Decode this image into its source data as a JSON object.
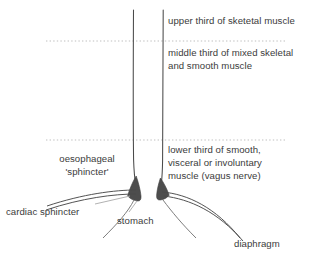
{
  "diagram": {
    "colors": {
      "text": "#3b3b3b",
      "stroke": "#4a4a4a",
      "wedge_fill": "#4d4d4d",
      "divider": "#bfbfbf",
      "leader": "#9a9a9a",
      "background": "#ffffff"
    },
    "labels": {
      "upper_third": "upper third of sketetal muscle",
      "middle_third_line1": "middle third of mixed skeletal",
      "middle_third_line2": "and smooth muscle",
      "lower_third_line1": "lower third of smooth,",
      "lower_third_line2": "visceral or involuntary",
      "lower_third_line3": "muscle (vagus nerve)",
      "oesophageal_line1": "oesophageal",
      "oesophageal_line2": "'sphincter'",
      "cardiac_sphincter": "cardiac sphincter",
      "stomach": "stomach",
      "diaphragm": "diaphragm"
    },
    "dividers": [
      {
        "name": "upper-middle-divider",
        "y": 41
      },
      {
        "name": "middle-lower-divider",
        "y": 140
      }
    ]
  }
}
